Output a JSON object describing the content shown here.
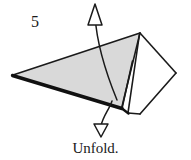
{
  "figure": {
    "step_number": "5",
    "caption": "Unfold.",
    "colors": {
      "paper_front": "#d9d9d9",
      "paper_back": "#ffffff",
      "outline": "#1a1a1a",
      "thick_edge": "#111111",
      "background": "#ffffff",
      "text": "#1a1a1a"
    },
    "diagram": {
      "type": "origami-step",
      "instruction": "Unfold.",
      "shapes": [
        {
          "name": "large-gray-triangle",
          "fill": "#d9d9d9",
          "points": "13,75 140,33 121,108"
        },
        {
          "name": "narrow-gray-sliver",
          "fill": "#d9d9d9",
          "points": "139,34 128,113 121,108 132,62"
        },
        {
          "name": "white-kite-right",
          "fill": "#ffffff",
          "points": "140,33 176,73 140,114 128,113"
        },
        {
          "name": "white-wedge-inner",
          "fill": "#ffffff",
          "points": "140,33 132,62 121,108 128,113"
        }
      ],
      "edges": [
        {
          "name": "thick-bottom-edge",
          "from": "13,75",
          "to": "121,108"
        },
        {
          "name": "top-edge",
          "from": "13,75",
          "to": "140,33"
        },
        {
          "name": "kite-upper-right-edge",
          "from": "140,33",
          "to": "176,73"
        },
        {
          "name": "kite-lower-right-edge",
          "from": "176,73",
          "to": "140,114"
        },
        {
          "name": "kite-bottom-left-edge",
          "from": "140,114",
          "to": "128,113"
        },
        {
          "name": "sliver-right-edge",
          "from": "139,34",
          "to": "128,113"
        },
        {
          "name": "sliver-left-edge",
          "from": "140,33",
          "to": "121,108"
        }
      ],
      "arrows": [
        {
          "name": "unfold-arrow-up",
          "direction": "up",
          "tip": "95,5",
          "tail": "117,100"
        },
        {
          "name": "unfold-arrow-down",
          "direction": "down",
          "tip": "101,136",
          "tail": "112,101"
        }
      ]
    }
  }
}
